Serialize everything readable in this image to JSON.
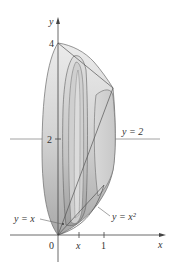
{
  "figure": {
    "type": "solid-of-revolution-diagram",
    "axes": {
      "x_label": "x",
      "y_label": "y",
      "origin_label": "0",
      "x_ticks": [
        {
          "label": "x",
          "italic": true
        },
        {
          "label": "1",
          "italic": false
        }
      ],
      "y_ticks": [
        {
          "label": "2"
        },
        {
          "label": "4"
        }
      ]
    },
    "annotations": {
      "axis_of_rotation": "y = 2",
      "curve_line": "y = x",
      "curve_parabola": "y = x²"
    },
    "colors": {
      "solid_light": "#e6e6e6",
      "solid_dark": "#a9a9a9",
      "outline": "#555555",
      "axis": "#444444",
      "text": "#333333"
    }
  }
}
